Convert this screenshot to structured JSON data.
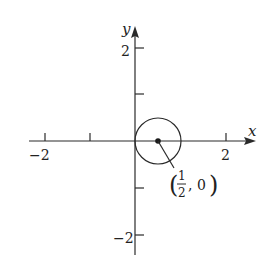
{
  "diagram": {
    "type": "circle-on-cartesian-plane",
    "axes": {
      "x_label": "x",
      "y_label": "y",
      "x_ticks": [
        -2,
        -1,
        1,
        2
      ],
      "y_ticks": [
        2,
        1,
        -1,
        -2
      ],
      "x_tick_labels": {
        "neg": "−2",
        "pos": "2"
      },
      "y_tick_labels": {
        "pos": "2",
        "neg": "−2"
      }
    },
    "circle": {
      "center": [
        0.5,
        0
      ],
      "radius": 0.5,
      "center_label_open": "(",
      "center_label_num": "1",
      "center_label_den": "2",
      "center_label_rest": ", 0",
      "center_label_close": ")"
    },
    "colors": {
      "stroke": "#2a2a2a",
      "text": "#222222",
      "background": "#ffffff"
    }
  }
}
